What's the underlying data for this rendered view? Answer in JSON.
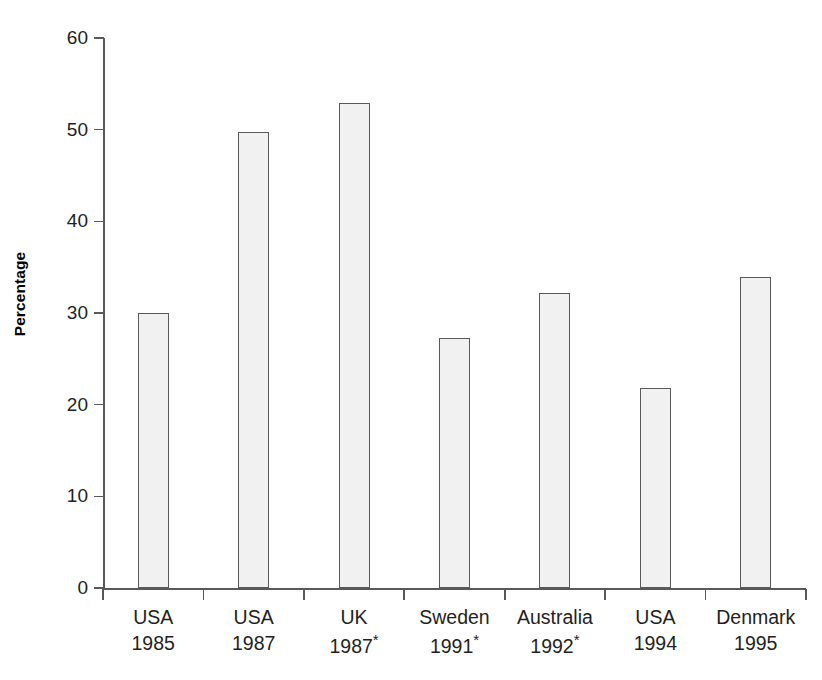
{
  "chart_data": {
    "type": "bar",
    "title": "",
    "xlabel": "",
    "ylabel": "Percentage",
    "ylim": [
      0,
      60
    ],
    "yticks": [
      0,
      10,
      20,
      30,
      40,
      50,
      60
    ],
    "ytick_labels": [
      "0",
      "10",
      "20",
      "30",
      "40",
      "50",
      "60"
    ],
    "grid": false,
    "legend": null,
    "categories": [
      "USA 1985",
      "USA 1987",
      "UK 1987*",
      "Sweden 1991*",
      "Australia 1992*",
      "USA 1994",
      "Denmark 1995"
    ],
    "category_parts": [
      {
        "name": "USA",
        "year": "1985",
        "starred": false
      },
      {
        "name": "USA",
        "year": "1987",
        "starred": false
      },
      {
        "name": "UK",
        "year": "1987",
        "starred": true
      },
      {
        "name": "Sweden",
        "year": "1991",
        "starred": true
      },
      {
        "name": "Australia",
        "year": "1992",
        "starred": true
      },
      {
        "name": "USA",
        "year": "1994",
        "starred": false
      },
      {
        "name": "Denmark",
        "year": "1995",
        "starred": false
      }
    ],
    "values": [
      30.0,
      49.7,
      52.9,
      27.3,
      32.2,
      21.8,
      33.9
    ],
    "colors": {
      "bar_fill": "#f1f1f1",
      "bar_border": "#58595b",
      "axis": "#58595b",
      "text": "#231f20",
      "background": "#ffffff"
    }
  },
  "footnote_marker": "*"
}
